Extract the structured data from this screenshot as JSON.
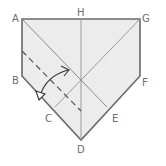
{
  "diagram": {
    "type": "origami-fold-step",
    "colors": {
      "paper_fill": "#ececec",
      "outline": "#6a6a6a",
      "crease": "#9a9a9a",
      "dashed": "#555555",
      "arrow": "#333333",
      "label": "#6d6d6d"
    },
    "labels": {
      "A": "A",
      "B": "B",
      "C": "C",
      "D": "D",
      "E": "E",
      "F": "F",
      "G": "G",
      "H": "H"
    }
  }
}
